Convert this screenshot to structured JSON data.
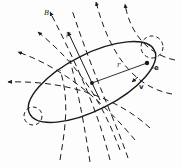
{
  "diagram": {
    "labels": {
      "field": "B",
      "moment": "μ",
      "radius": "r",
      "velocity": "v",
      "charge": "-e"
    },
    "elements": {
      "orbit": "tilted elliptical electron orbit",
      "field_lines": "dashed magnetic field lines with arrowheads",
      "nucleus": "center dot",
      "electron": "dot on orbit",
      "dipole_arrow": "solid arrow μ through center"
    },
    "colors": {
      "ink": "#1a1a1a",
      "background": "#fdfdfd"
    }
  }
}
